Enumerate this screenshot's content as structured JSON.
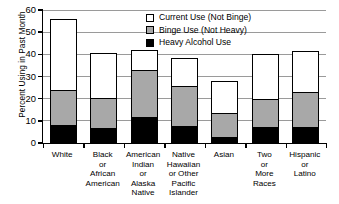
{
  "chart_data": {
    "type": "bar",
    "subtype": "stacked-vertical",
    "title": "",
    "xlabel": "",
    "ylabel": "Percent Using in Past Month",
    "ylim": [
      0,
      60
    ],
    "yticks": [
      0,
      10,
      20,
      30,
      40,
      50,
      60
    ],
    "grid": true,
    "legend_position": "top-right-inside",
    "categories": [
      "White",
      "Black or African American",
      "American Indian or Alaska Native",
      "Native Hawaiian or Other Pacific Islander",
      "Asian",
      "Two or More Races",
      "Hispanic or Latino"
    ],
    "category_lines": [
      [
        "White"
      ],
      [
        "Black",
        "or",
        "African",
        "American"
      ],
      [
        "American",
        "Indian",
        "or",
        "Alaska",
        "Native"
      ],
      [
        "Native",
        "Hawaiian",
        "or Other",
        "Pacific",
        "Islander"
      ],
      [
        "Asian"
      ],
      [
        "Two",
        "or",
        "More",
        "Races"
      ],
      [
        "Hispanic",
        "or",
        "Latino"
      ]
    ],
    "series": [
      {
        "name": "Heavy Alcohol Use",
        "color": "#000000",
        "values": [
          7.6,
          6.3,
          11.3,
          7.2,
          2.3,
          6.8,
          6.8
        ]
      },
      {
        "name": "Binge Use (Not Heavy)",
        "color": "#a8a8a8",
        "values": [
          15.9,
          13.5,
          21.2,
          18.1,
          10.7,
          12.6,
          15.7
        ]
      },
      {
        "name": "Current Use (Not Binge)",
        "color": "#ffffff",
        "values": [
          32.5,
          20.8,
          9.5,
          13.1,
          15.0,
          20.6,
          19.0
        ]
      }
    ],
    "totals": [
      56.0,
      40.6,
      42.0,
      38.4,
      28.0,
      40.0,
      41.5
    ]
  },
  "legend": {
    "items": [
      {
        "label": "Current Use (Not Binge)",
        "swatch": "white"
      },
      {
        "label": "Binge Use (Not Heavy)",
        "swatch": "gray"
      },
      {
        "label": "Heavy Alcohol Use",
        "swatch": "black"
      }
    ]
  },
  "footnote": ""
}
